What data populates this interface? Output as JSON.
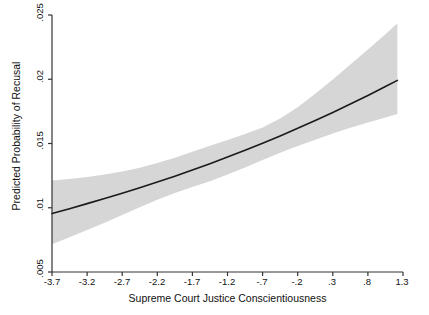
{
  "chart_data": {
    "type": "line",
    "title": "",
    "subtitle": "",
    "xlabel": "Supreme Court Justice Conscientiousness",
    "ylabel": "Predicted Probability of Recusal",
    "xlim": [
      -3.7,
      1.3
    ],
    "ylim": [
      0.005,
      0.025
    ],
    "grid": false,
    "legend": null,
    "xticks": [
      "-3.7",
      "-3.2",
      "-2.7",
      "-2.2",
      "-1.7",
      "-1.2",
      "-.7",
      "-.2",
      ".3",
      ".8",
      "1.3"
    ],
    "xtick_values": [
      -3.7,
      -3.2,
      -2.7,
      -2.2,
      -1.7,
      -1.2,
      -0.7,
      -0.2,
      0.3,
      0.8,
      1.3
    ],
    "yticks": [
      ".005",
      ".01",
      ".015",
      ".02",
      ".025"
    ],
    "ytick_values": [
      0.005,
      0.01,
      0.015,
      0.02,
      0.025
    ],
    "x": [
      -3.7,
      -3.45,
      -3.2,
      -2.95,
      -2.7,
      -2.45,
      -2.2,
      -1.95,
      -1.7,
      -1.45,
      -1.2,
      -0.95,
      -0.7,
      -0.45,
      -0.2,
      0.05,
      0.3,
      0.55,
      0.8,
      1.05,
      1.22
    ],
    "series": [
      {
        "name": "Predicted probability",
        "color": "#1a1a1a",
        "values": [
          0.00955,
          0.00993,
          0.01032,
          0.01072,
          0.01113,
          0.01156,
          0.012,
          0.01246,
          0.01294,
          0.01343,
          0.01394,
          0.01447,
          0.01502,
          0.01559,
          0.01618,
          0.01679,
          0.01742,
          0.01807,
          0.01874,
          0.01943,
          0.01991
        ]
      }
    ],
    "confidence_band": {
      "name": "95% confidence interval",
      "color": "#d6d6d6",
      "upper": [
        0.01212,
        0.01224,
        0.01239,
        0.01258,
        0.01282,
        0.01312,
        0.01348,
        0.0139,
        0.01436,
        0.01482,
        0.01527,
        0.01573,
        0.01625,
        0.01694,
        0.01783,
        0.01887,
        0.01999,
        0.02114,
        0.02231,
        0.0235,
        0.02436
      ],
      "lower": [
        0.00716,
        0.00771,
        0.00827,
        0.00884,
        0.00943,
        0.01003,
        0.01062,
        0.01115,
        0.01161,
        0.01207,
        0.01258,
        0.01313,
        0.01372,
        0.01428,
        0.0148,
        0.0153,
        0.01577,
        0.01622,
        0.01664,
        0.01703,
        0.0173
      ]
    },
    "axis_color": "#333333",
    "background": "#ffffff"
  }
}
